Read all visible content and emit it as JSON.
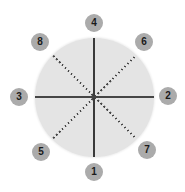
{
  "figure": {
    "background_color": "#ffffff",
    "circle": {
      "description": "large circle divided into 8 equal sectors",
      "fill_color": "#e4e4e4",
      "solid_line_color": "#3a3a3a",
      "dotted_line_color": "#454545",
      "solid_lines": [
        "vertical-diameter",
        "horizontal-diameter"
      ],
      "dotted_lines": [
        "nw-se-diagonal",
        "ne-sw-diagonal"
      ],
      "sector_count": 8
    },
    "node_style": {
      "fill_color": "#ababab",
      "text_color": "#1a1a1a"
    },
    "nodes": [
      {
        "label": "1",
        "position": "bottom"
      },
      {
        "label": "2",
        "position": "right"
      },
      {
        "label": "3",
        "position": "left"
      },
      {
        "label": "4",
        "position": "top"
      },
      {
        "label": "5",
        "position": "bottom-left"
      },
      {
        "label": "6",
        "position": "top-right"
      },
      {
        "label": "7",
        "position": "bottom-right"
      },
      {
        "label": "8",
        "position": "top-left"
      }
    ]
  }
}
